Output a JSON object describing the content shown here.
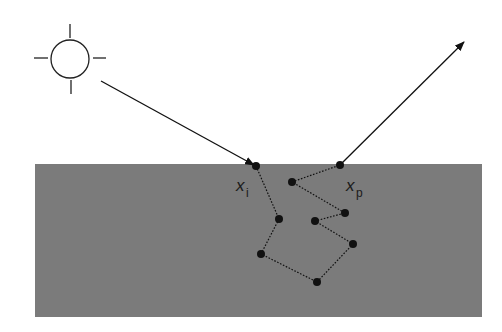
{
  "diagram": {
    "colors": {
      "background": "#ffffff",
      "medium": "#7b7b7b",
      "ink": "#111111"
    },
    "light_source": {
      "icon": "sun-icon",
      "center": [
        70,
        59
      ],
      "radius": 19
    },
    "slab": {
      "x": 35,
      "y": 164,
      "width": 447,
      "height": 153
    },
    "incident_ray": {
      "from": [
        101,
        81
      ],
      "to": [
        256,
        166
      ]
    },
    "exit_ray": {
      "from": [
        340,
        165
      ],
      "to": [
        463,
        43
      ]
    },
    "labels": {
      "entry": {
        "main": "x",
        "sub": "i"
      },
      "exit": {
        "main": "x",
        "sub": "p"
      }
    },
    "path_points": [
      [
        256,
        166
      ],
      [
        279,
        219
      ],
      [
        261,
        254
      ],
      [
        317,
        282
      ],
      [
        353,
        244
      ],
      [
        315,
        221
      ],
      [
        345,
        213
      ],
      [
        292,
        182
      ],
      [
        340,
        165
      ]
    ]
  }
}
